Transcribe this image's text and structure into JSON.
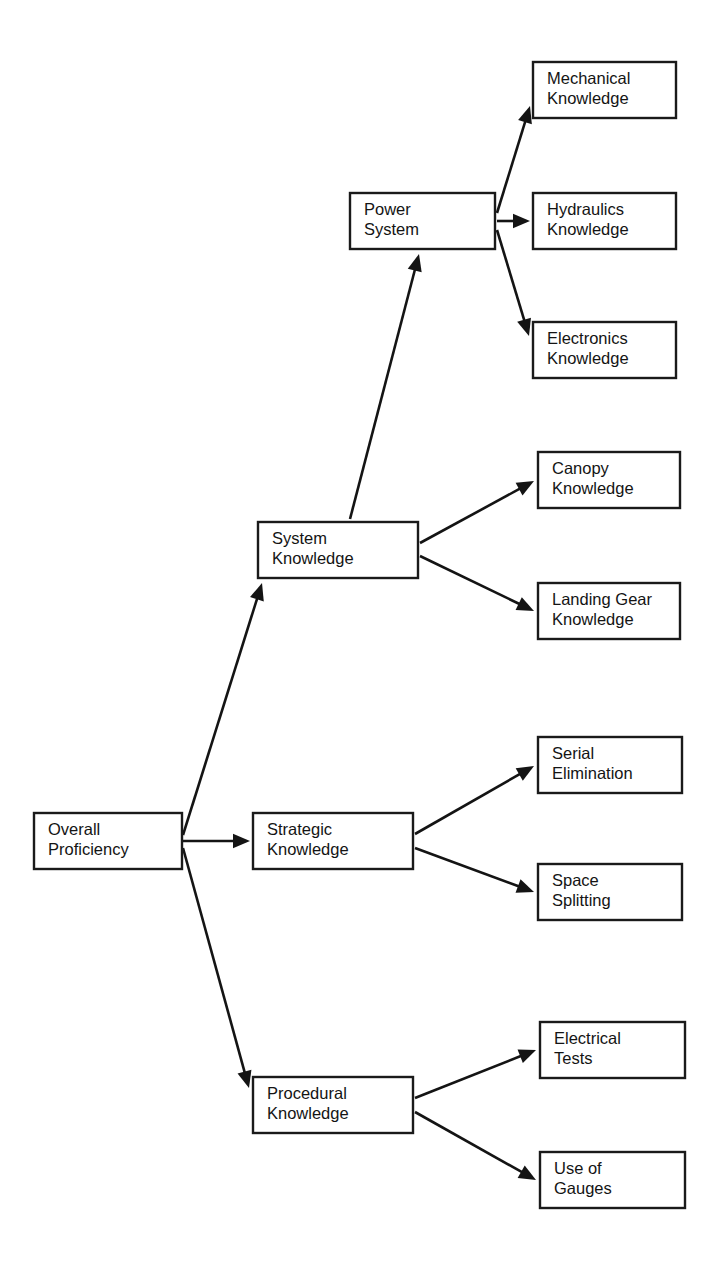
{
  "page": {
    "header_faint_text": "",
    "background_color": "#ffffff",
    "line_color": "#141414",
    "box_fill_color": "#ffffff"
  },
  "diagram": {
    "type": "hierarchy-tree",
    "orientation": "left-to-right",
    "levels": 3
  },
  "nodes": [
    {
      "id": "overall-proficiency",
      "lines": [
        "Overall",
        "Proficiency"
      ],
      "level": 0,
      "x": 34,
      "y": 813,
      "w": 148,
      "h": 56
    },
    {
      "id": "system-knowledge",
      "lines": [
        "System",
        "Knowledge"
      ],
      "level": 1,
      "x": 258,
      "y": 522,
      "w": 160,
      "h": 56
    },
    {
      "id": "strategic-knowledge",
      "lines": [
        "Strategic",
        "Knowledge"
      ],
      "level": 1,
      "x": 253,
      "y": 813,
      "w": 160,
      "h": 56
    },
    {
      "id": "procedural-knowledge",
      "lines": [
        "Procedural",
        "Knowledge"
      ],
      "level": 1,
      "x": 253,
      "y": 1077,
      "w": 160,
      "h": 56
    },
    {
      "id": "power-system",
      "lines": [
        "Power",
        "System"
      ],
      "level": 2,
      "x": 350,
      "y": 193,
      "w": 145,
      "h": 56
    },
    {
      "id": "mechanical-knowledge",
      "lines": [
        "Mechanical",
        "Knowledge"
      ],
      "level": 3,
      "x": 533,
      "y": 62,
      "w": 143,
      "h": 56
    },
    {
      "id": "hydraulics-knowledge",
      "lines": [
        "Hydraulics",
        "Knowledge"
      ],
      "level": 3,
      "x": 533,
      "y": 193,
      "w": 143,
      "h": 56
    },
    {
      "id": "electronics-knowledge",
      "lines": [
        "Electronics",
        "Knowledge"
      ],
      "level": 3,
      "x": 533,
      "y": 322,
      "w": 143,
      "h": 56
    },
    {
      "id": "canopy-knowledge",
      "lines": [
        "Canopy",
        "Knowledge"
      ],
      "level": 2,
      "x": 538,
      "y": 452,
      "w": 142,
      "h": 56
    },
    {
      "id": "landing-gear-knowledge",
      "lines": [
        "Landing Gear",
        "Knowledge"
      ],
      "level": 2,
      "x": 538,
      "y": 583,
      "w": 142,
      "h": 56
    },
    {
      "id": "serial-elimination",
      "lines": [
        "Serial",
        "Elimination"
      ],
      "level": 2,
      "x": 538,
      "y": 737,
      "w": 144,
      "h": 56
    },
    {
      "id": "space-splitting",
      "lines": [
        "Space",
        "Splitting"
      ],
      "level": 2,
      "x": 538,
      "y": 864,
      "w": 144,
      "h": 56
    },
    {
      "id": "electrical-tests",
      "lines": [
        "Electrical",
        "Tests"
      ],
      "level": 2,
      "x": 540,
      "y": 1022,
      "w": 145,
      "h": 56
    },
    {
      "id": "use-of-gauges",
      "lines": [
        "Use of",
        "Gauges"
      ],
      "level": 2,
      "x": 540,
      "y": 1152,
      "w": 145,
      "h": 56
    }
  ],
  "edges": [
    {
      "id": "edge-overall-to-system",
      "from": "overall-proficiency",
      "to": "system-knowledge",
      "x1": 183,
      "y1": 835,
      "x2": 262,
      "y2": 583
    },
    {
      "id": "edge-overall-to-strategic",
      "from": "overall-proficiency",
      "to": "strategic-knowledge",
      "x1": 183,
      "y1": 841,
      "x2": 250,
      "y2": 841
    },
    {
      "id": "edge-overall-to-procedural",
      "from": "overall-proficiency",
      "to": "procedural-knowledge",
      "x1": 183,
      "y1": 848,
      "x2": 249,
      "y2": 1088
    },
    {
      "id": "edge-system-to-power",
      "from": "system-knowledge",
      "to": "power-system",
      "x1": 350,
      "y1": 519,
      "x2": 419,
      "y2": 254
    },
    {
      "id": "edge-system-to-canopy",
      "from": "system-knowledge",
      "to": "canopy-knowledge",
      "x1": 420,
      "y1": 543,
      "x2": 534,
      "y2": 481
    },
    {
      "id": "edge-system-to-landing-gear",
      "from": "system-knowledge",
      "to": "landing-gear-knowledge",
      "x1": 420,
      "y1": 556,
      "x2": 534,
      "y2": 611
    },
    {
      "id": "edge-power-to-mechanical",
      "from": "power-system",
      "to": "mechanical-knowledge",
      "x1": 497,
      "y1": 213,
      "x2": 530,
      "y2": 106
    },
    {
      "id": "edge-power-to-hydraulics",
      "from": "power-system",
      "to": "hydraulics-knowledge",
      "x1": 497,
      "y1": 221,
      "x2": 530,
      "y2": 221
    },
    {
      "id": "edge-power-to-electronics",
      "from": "power-system",
      "to": "electronics-knowledge",
      "x1": 497,
      "y1": 230,
      "x2": 529,
      "y2": 336
    },
    {
      "id": "edge-strategic-to-serial",
      "from": "strategic-knowledge",
      "to": "serial-elimination",
      "x1": 415,
      "y1": 834,
      "x2": 534,
      "y2": 766
    },
    {
      "id": "edge-strategic-to-space",
      "from": "strategic-knowledge",
      "to": "space-splitting",
      "x1": 415,
      "y1": 848,
      "x2": 534,
      "y2": 892
    },
    {
      "id": "edge-procedural-to-electrical",
      "from": "procedural-knowledge",
      "to": "electrical-tests",
      "x1": 415,
      "y1": 1098,
      "x2": 536,
      "y2": 1050
    },
    {
      "id": "edge-procedural-to-gauges",
      "from": "procedural-knowledge",
      "to": "use-of-gauges",
      "x1": 415,
      "y1": 1112,
      "x2": 536,
      "y2": 1180
    }
  ]
}
